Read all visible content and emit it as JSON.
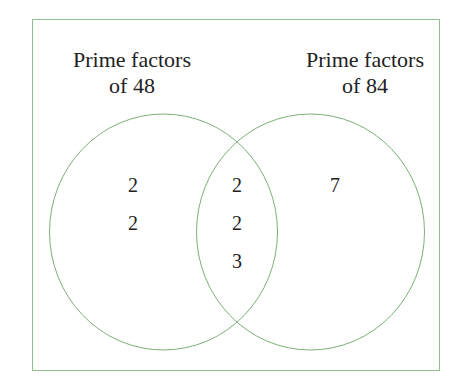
{
  "diagram": {
    "type": "venn",
    "border_color": "#8fbf8a",
    "circle_color": "#7fae7b",
    "sets": [
      {
        "label_line1": "Prime factors",
        "label_line2": "of 48",
        "only": [
          "2",
          "2"
        ]
      },
      {
        "label_line1": "Prime factors",
        "label_line2": "of 84",
        "only": [
          "7"
        ]
      }
    ],
    "intersection": [
      "2",
      "2",
      "3"
    ]
  }
}
